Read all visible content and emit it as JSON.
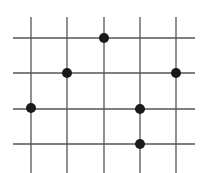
{
  "diagram": {
    "type": "grid-with-points",
    "background": "#ffffff",
    "line_color": "#555555",
    "dot_color": "#1a1a1a",
    "dot_radius": 5,
    "vertical_lines": [
      {
        "x": 31,
        "y1": 17,
        "y2": 173
      },
      {
        "x": 67,
        "y1": 17,
        "y2": 173
      },
      {
        "x": 104,
        "y1": 17,
        "y2": 173
      },
      {
        "x": 140,
        "y1": 17,
        "y2": 173
      },
      {
        "x": 176,
        "y1": 17,
        "y2": 173
      }
    ],
    "horizontal_lines": [
      {
        "y": 38,
        "x1": 13,
        "x2": 195
      },
      {
        "y": 73,
        "x1": 13,
        "x2": 195
      },
      {
        "y": 109,
        "x1": 13,
        "x2": 195
      },
      {
        "y": 144,
        "x1": 13,
        "x2": 195
      }
    ],
    "points": [
      {
        "col": 3,
        "row": 1,
        "x": 104,
        "y": 38
      },
      {
        "col": 2,
        "row": 2,
        "x": 67,
        "y": 73
      },
      {
        "col": 5,
        "row": 2,
        "x": 176,
        "y": 73
      },
      {
        "col": 1,
        "row": 3,
        "x": 31,
        "y": 108
      },
      {
        "col": 4,
        "row": 3,
        "x": 140,
        "y": 109
      },
      {
        "col": 4,
        "row": 4,
        "x": 140,
        "y": 144
      }
    ]
  }
}
